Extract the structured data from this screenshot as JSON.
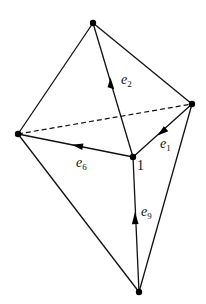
{
  "diagram": {
    "type": "wireframe-polyhedron",
    "colors": {
      "stroke": "#111111",
      "vertex": "#000000",
      "background": "#ffffff"
    },
    "vertices": {
      "top": {
        "x": 93,
        "y": 23
      },
      "right": {
        "x": 192,
        "y": 104
      },
      "left": {
        "x": 18,
        "y": 134
      },
      "center": {
        "x": 133,
        "y": 157,
        "label": "1"
      },
      "bottom": {
        "x": 139,
        "y": 292
      }
    },
    "edges": [
      {
        "from": "top",
        "to": "left",
        "style": "solid"
      },
      {
        "from": "top",
        "to": "right",
        "style": "solid"
      },
      {
        "from": "top",
        "to": "center",
        "style": "solid"
      },
      {
        "from": "left",
        "to": "right",
        "style": "dashed"
      },
      {
        "from": "left",
        "to": "center",
        "style": "solid"
      },
      {
        "from": "right",
        "to": "center",
        "style": "solid"
      },
      {
        "from": "left",
        "to": "bottom",
        "style": "solid"
      },
      {
        "from": "right",
        "to": "bottom",
        "style": "solid"
      },
      {
        "from": "center",
        "to": "bottom",
        "style": "solid"
      }
    ],
    "vectors": [
      {
        "name": "e2",
        "base": "e",
        "sub": "2",
        "edge": "center-top",
        "direction": "toward top"
      },
      {
        "name": "e1",
        "base": "e",
        "sub": "1",
        "edge": "right-center",
        "direction": "toward center"
      },
      {
        "name": "e6",
        "base": "e",
        "sub": "6",
        "edge": "center-left",
        "direction": "toward left"
      },
      {
        "name": "e9",
        "base": "e",
        "sub": "9",
        "edge": "bottom-center",
        "direction": "toward center"
      }
    ],
    "labels": {
      "e2": {
        "base": "e",
        "sub": "2"
      },
      "e1": {
        "base": "e",
        "sub": "1"
      },
      "e6": {
        "base": "e",
        "sub": "6"
      },
      "e9": {
        "base": "e",
        "sub": "9"
      },
      "node": "1"
    }
  }
}
